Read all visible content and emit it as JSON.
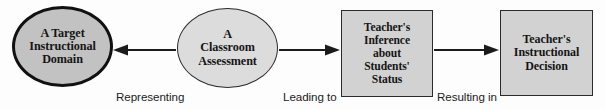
{
  "diagram": {
    "background_color": "#fdfdfd",
    "text_color": "#151515",
    "nodes": [
      {
        "id": "target-domain",
        "shape": "ellipse",
        "label": "A Target\nInstructional\nDomain",
        "fill": "#c2c2c2",
        "stroke": "#111111",
        "stroke_width": 3
      },
      {
        "id": "classroom-assessment",
        "shape": "ellipse",
        "label": "A\nClassroom\nAssessment",
        "fill": "#dcdcdc",
        "stroke": "#2b2b2b",
        "stroke_width": 1.4
      },
      {
        "id": "teacher-inference",
        "shape": "rectangle",
        "label": "Teacher's\nInference\nabout\nStudents'\nStatus",
        "fill": "#d2d2d2",
        "stroke": "#2b2b2b",
        "stroke_width": 1.4
      },
      {
        "id": "instructional-decision",
        "shape": "rectangle",
        "label": "Teacher's\nInstructional\nDecision",
        "fill": "#d2d2d2",
        "stroke": "#2b2b2b",
        "stroke_width": 1.4
      }
    ],
    "edges": [
      {
        "id": "representing",
        "label": "Representing",
        "from": "classroom-assessment",
        "to": "target-domain",
        "direction": "left"
      },
      {
        "id": "leading-to",
        "label": "Leading to",
        "from": "classroom-assessment",
        "to": "teacher-inference",
        "direction": "right"
      },
      {
        "id": "resulting-in",
        "label": "Resulting in",
        "from": "teacher-inference",
        "to": "instructional-decision",
        "direction": "right"
      }
    ]
  }
}
